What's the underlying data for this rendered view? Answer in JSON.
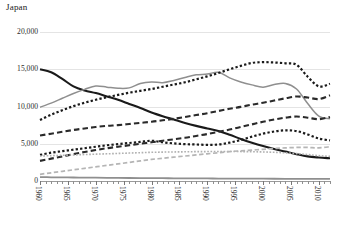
{
  "chart_data": {
    "type": "line",
    "title": "Japan",
    "xlabel": "",
    "ylabel": "",
    "ylim": [
      0,
      20000
    ],
    "xlim": [
      1960,
      2012
    ],
    "grid": true,
    "legend": "none",
    "yticks": [
      "0",
      "5,000",
      "10,000",
      "15,000",
      "20,000"
    ],
    "ytick_values": [
      0,
      5000,
      10000,
      15000,
      20000
    ],
    "xticks": [
      "1960",
      "1965",
      "1970",
      "1975",
      "1980",
      "1985",
      "1990",
      "1995",
      "2000",
      "2005",
      "2010"
    ],
    "xtick_values": [
      1960,
      1965,
      1970,
      1975,
      1980,
      1985,
      1990,
      1995,
      2000,
      2005,
      2010
    ],
    "x": [
      1960,
      1962,
      1964,
      1966,
      1968,
      1970,
      1972,
      1974,
      1976,
      1978,
      1980,
      1982,
      1984,
      1986,
      1988,
      1990,
      1992,
      1994,
      1996,
      1998,
      2000,
      2002,
      2004,
      2006,
      2008,
      2010,
      2012
    ],
    "series": [
      {
        "name": "series-black-solid",
        "color": "#1a1a1a",
        "style": "solid",
        "width": 2.1,
        "values": [
          15000,
          14600,
          13700,
          12700,
          12150,
          11800,
          11350,
          10900,
          10350,
          9800,
          9200,
          8700,
          8250,
          7800,
          7400,
          7050,
          6700,
          6200,
          5650,
          5150,
          4700,
          4300,
          3950,
          3600,
          3300,
          3150,
          3050
        ]
      },
      {
        "name": "series-gray-solid",
        "color": "#8f8f8f",
        "style": "solid",
        "width": 1.5,
        "values": [
          9900,
          10450,
          11100,
          11750,
          12300,
          12750,
          12600,
          12450,
          12500,
          13100,
          13300,
          13200,
          13500,
          13900,
          14250,
          14350,
          14600,
          13850,
          13300,
          12900,
          12600,
          12950,
          13100,
          12350,
          10400,
          8700,
          8350
        ]
      },
      {
        "name": "series-black-dotted",
        "color": "#1a1a1a",
        "style": "dotted",
        "width": 2.2,
        "values": [
          8200,
          8900,
          9500,
          10050,
          10500,
          10900,
          11250,
          11550,
          11850,
          12100,
          12350,
          12650,
          12950,
          13250,
          13650,
          14050,
          14500,
          15000,
          15450,
          15850,
          15950,
          15900,
          15800,
          15600,
          14000,
          12700,
          13050
        ]
      },
      {
        "name": "series-black-dashed-upper",
        "color": "#2a2a2a",
        "style": "dashed",
        "width": 2.1,
        "values": [
          6100,
          6350,
          6600,
          6850,
          7050,
          7250,
          7400,
          7500,
          7650,
          7800,
          7950,
          8150,
          8350,
          8600,
          8850,
          9100,
          9400,
          9700,
          9950,
          10250,
          10500,
          10800,
          11100,
          11350,
          11200,
          11000,
          11500
        ]
      },
      {
        "name": "series-black-dotted-lower",
        "color": "#1a1a1a",
        "style": "dotted",
        "width": 2.2,
        "values": [
          3500,
          3800,
          4000,
          4200,
          4400,
          4600,
          4800,
          4950,
          5100,
          5250,
          5400,
          5200,
          5050,
          4950,
          4900,
          4850,
          4900,
          5150,
          5500,
          5950,
          6350,
          6650,
          6800,
          6700,
          6250,
          5700,
          5450
        ]
      },
      {
        "name": "series-black-dashed-lower",
        "color": "#2a2a2a",
        "style": "dashed",
        "width": 2.1,
        "values": [
          2700,
          3000,
          3300,
          3600,
          3900,
          4150,
          4400,
          4600,
          4800,
          5000,
          5200,
          5400,
          5600,
          5800,
          6050,
          6300,
          6600,
          6900,
          7250,
          7600,
          7950,
          8250,
          8500,
          8650,
          8500,
          8300,
          8600
        ]
      },
      {
        "name": "series-gray-dotted",
        "color": "#b0b0b0",
        "style": "dotted",
        "width": 1.6,
        "values": [
          3350,
          3400,
          3450,
          3500,
          3550,
          3600,
          3650,
          3700,
          3750,
          3800,
          3850,
          3880,
          3900,
          3920,
          3940,
          3950,
          3960,
          3960,
          3950,
          3930,
          3900,
          3850,
          3780,
          3680,
          3550,
          3400,
          3300
        ]
      },
      {
        "name": "series-gray-dashed",
        "color": "#b5b5b5",
        "style": "dashed",
        "width": 1.7,
        "values": [
          900,
          1100,
          1300,
          1500,
          1700,
          1900,
          2100,
          2300,
          2500,
          2700,
          2900,
          3050,
          3200,
          3350,
          3500,
          3650,
          3800,
          3950,
          4050,
          4150,
          4250,
          4350,
          4450,
          4500,
          4500,
          4450,
          4600
        ]
      },
      {
        "name": "series-gray-baseline",
        "color": "#8f8f8f",
        "style": "solid",
        "width": 1.8,
        "values": [
          520,
          500,
          485,
          470,
          455,
          440,
          425,
          415,
          405,
          395,
          385,
          375,
          365,
          355,
          348,
          340,
          332,
          325,
          318,
          312,
          306,
          300,
          295,
          290,
          285,
          280,
          275
        ]
      }
    ]
  }
}
